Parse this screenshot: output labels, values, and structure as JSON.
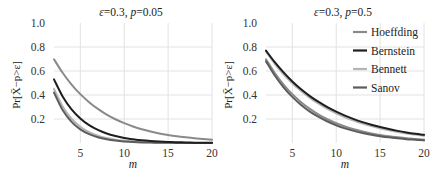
{
  "chart_data": [
    {
      "type": "line",
      "title": "ε=0.3, p=0.05",
      "title_parts": {
        "eps_sym": "ε",
        "eps_val": "=0.3, ",
        "p_sym": "p",
        "p_val": "=0.05"
      },
      "xlabel": "m",
      "ylabel": "Pr[X̄−p>ε]",
      "xlim": [
        2,
        20
      ],
      "ylim": [
        0,
        1.0
      ],
      "xticks": [
        5,
        10,
        15,
        20
      ],
      "yticks": [
        0.2,
        0.4,
        0.6,
        0.8,
        1.0
      ],
      "ytick_labels": [
        "0.2",
        "0.4",
        "0.6",
        "0.8",
        "1.0"
      ],
      "grid": true,
      "legend": false,
      "x": [
        2,
        3,
        4,
        5,
        6,
        7,
        8,
        9,
        10,
        11,
        12,
        13,
        14,
        15,
        16,
        17,
        18,
        19,
        20
      ],
      "series": [
        {
          "name": "Hoeffding",
          "color": "#8a8a8a",
          "values": [
            0.698,
            0.583,
            0.487,
            0.407,
            0.34,
            0.284,
            0.237,
            0.198,
            0.165,
            0.138,
            0.115,
            0.096,
            0.08,
            0.067,
            0.056,
            0.047,
            0.039,
            0.033,
            0.027
          ]
        },
        {
          "name": "Bernstein",
          "color": "#1e1e1e",
          "values": [
            0.53,
            0.386,
            0.281,
            0.205,
            0.149,
            0.109,
            0.079,
            0.058,
            0.042,
            0.031,
            0.022,
            0.016,
            0.012,
            0.009,
            0.006,
            0.005,
            0.003,
            0.002,
            0.002
          ]
        },
        {
          "name": "Bennett",
          "color": "#b4b4b4",
          "values": [
            0.45,
            0.302,
            0.202,
            0.136,
            0.091,
            0.061,
            0.041,
            0.027,
            0.018,
            0.012,
            0.008,
            0.006,
            0.004,
            0.003,
            0.002,
            0.001,
            0.001,
            0.001,
            0.0
          ]
        },
        {
          "name": "Sanov",
          "color": "#5c5c5c",
          "values": [
            0.42,
            0.272,
            0.176,
            0.114,
            0.074,
            0.048,
            0.031,
            0.02,
            0.013,
            0.008,
            0.005,
            0.004,
            0.002,
            0.002,
            0.001,
            0.001,
            0.0,
            0.0,
            0.0
          ]
        }
      ]
    },
    {
      "type": "line",
      "title": "ε=0.3, p=0.5",
      "title_parts": {
        "eps_sym": "ε",
        "eps_val": "=0.3, ",
        "p_sym": "p",
        "p_val": "=0.5"
      },
      "xlabel": "m",
      "ylabel": "Pr[X̄−p>ε]",
      "xlim": [
        2,
        20
      ],
      "ylim": [
        0,
        1.0
      ],
      "xticks": [
        5,
        10,
        15,
        20
      ],
      "yticks": [
        0.2,
        0.4,
        0.6,
        0.8,
        1.0
      ],
      "ytick_labels": [
        "0.2",
        "0.4",
        "0.6",
        "0.8",
        "1.0"
      ],
      "grid": true,
      "legend": true,
      "legend_position": "upper right",
      "x": [
        2,
        3,
        4,
        5,
        6,
        7,
        8,
        9,
        10,
        11,
        12,
        13,
        14,
        15,
        16,
        17,
        18,
        19,
        20
      ],
      "series": [
        {
          "name": "Hoeffding",
          "color": "#8a8a8a",
          "values": [
            0.698,
            0.583,
            0.487,
            0.407,
            0.34,
            0.284,
            0.237,
            0.198,
            0.165,
            0.138,
            0.115,
            0.096,
            0.08,
            0.067,
            0.056,
            0.047,
            0.039,
            0.033,
            0.027
          ]
        },
        {
          "name": "Bernstein",
          "color": "#1e1e1e",
          "values": [
            0.77,
            0.673,
            0.588,
            0.513,
            0.448,
            0.391,
            0.342,
            0.298,
            0.261,
            0.228,
            0.199,
            0.174,
            0.152,
            0.133,
            0.116,
            0.101,
            0.088,
            0.077,
            0.068
          ]
        },
        {
          "name": "Bennett",
          "color": "#b4b4b4",
          "values": [
            0.76,
            0.66,
            0.573,
            0.498,
            0.433,
            0.376,
            0.327,
            0.284,
            0.247,
            0.214,
            0.186,
            0.162,
            0.141,
            0.122,
            0.106,
            0.092,
            0.08,
            0.07,
            0.06
          ]
        },
        {
          "name": "Sanov",
          "color": "#5c5c5c",
          "values": [
            0.68,
            0.562,
            0.464,
            0.384,
            0.317,
            0.262,
            0.217,
            0.179,
            0.148,
            0.122,
            0.101,
            0.084,
            0.069,
            0.057,
            0.047,
            0.039,
            0.032,
            0.027,
            0.022
          ]
        }
      ]
    }
  ]
}
